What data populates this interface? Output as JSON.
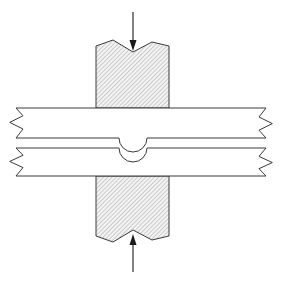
{
  "figure": {
    "type": "engineering-cross-section-diagram",
    "title": "",
    "background_color": "#ffffff",
    "canvas": {
      "width": 282,
      "height": 284
    }
  },
  "style": {
    "line_color": "#3a3a3a",
    "line_width": 1,
    "hatch_color": "#9a9a9a",
    "hatch_fill": "#f2f2f2",
    "plate_fill": "#ffffff",
    "arrow_color": "#1a1a1a"
  },
  "elements": {
    "vertical_member": {
      "label": "hatched-vertical-bar",
      "description": "vertical hatched member passing through both plates",
      "left_x": 96,
      "right_x": 169,
      "top_break_y": 46,
      "bottom_break_y": 240,
      "fill": "hatch",
      "top_break_profile": [
        [
          96,
          46
        ],
        [
          113,
          40
        ],
        [
          133,
          52
        ],
        [
          152,
          42
        ],
        [
          169,
          46
        ]
      ],
      "bottom_break_profile": [
        [
          96,
          236
        ],
        [
          113,
          242
        ],
        [
          133,
          230
        ],
        [
          152,
          240
        ],
        [
          169,
          236
        ]
      ]
    },
    "upper_plate": {
      "label": "upper-horizontal-plate",
      "left_x": 16,
      "right_x": 266,
      "top_y": 108,
      "bottom_y": 138,
      "notch": {
        "shape": "semicircle",
        "center_x": 133,
        "center_y": 138,
        "radius": 14,
        "direction": "downward"
      }
    },
    "lower_plate": {
      "label": "lower-horizontal-plate",
      "left_x": 16,
      "right_x": 266,
      "top_y": 148,
      "bottom_y": 176,
      "notch": {
        "shape": "semicircle",
        "center_x": 133,
        "center_y": 148,
        "radius": 14,
        "direction": "upward"
      }
    },
    "break_lines": {
      "label": "conventional-break-lines",
      "count": 4,
      "positions": [
        "upper-plate-left",
        "upper-plate-right",
        "lower-plate-left",
        "lower-plate-right"
      ]
    },
    "load_arrow_top": {
      "label": "top-load-arrow",
      "direction": "down",
      "x": 133,
      "tail_y": 12,
      "tip_y": 51,
      "head_width": 7,
      "head_length": 11
    },
    "load_arrow_bottom": {
      "label": "bottom-load-arrow",
      "direction": "up",
      "x": 133,
      "tail_y": 272,
      "tip_y": 234,
      "head_width": 7,
      "head_length": 11
    }
  },
  "annotations": {
    "texts": []
  }
}
